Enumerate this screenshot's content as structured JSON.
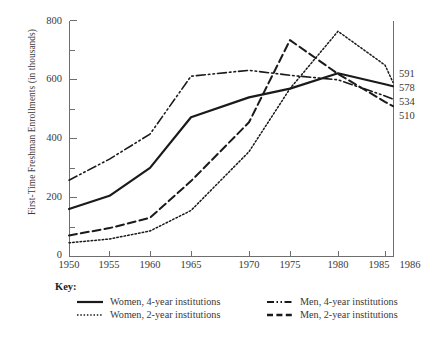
{
  "chart_data": {
    "type": "line",
    "title": "",
    "xlabel": "",
    "ylabel": "First-Time Freshman Enrollments (in thousands)",
    "x": [
      1950,
      1955,
      1960,
      1965,
      1970,
      1975,
      1980,
      1985,
      1986
    ],
    "xtick_labels": [
      "1950",
      "1955",
      "1960",
      "1965",
      "1970",
      "1975",
      "1980",
      "1985",
      "1986"
    ],
    "ytick_labels": [
      "0",
      "200",
      "400",
      "600",
      "800"
    ],
    "ytick_values": [
      0,
      200,
      400,
      600,
      800
    ],
    "yminor_values": [
      100,
      300,
      500,
      700
    ],
    "ylim": [
      0,
      800
    ],
    "grid": false,
    "legend_position": "below-plot",
    "series": [
      {
        "name": "Women, 4-year institutions",
        "style": "solid",
        "color": "#1a1a1a",
        "values": [
          160,
          205,
          300,
          472,
          540,
          570,
          622,
          585,
          578
        ],
        "end_label": "578"
      },
      {
        "name": "Women, 2-year institutions",
        "style": "dotted",
        "color": "#1a1a1a",
        "values": [
          45,
          58,
          85,
          155,
          355,
          570,
          765,
          650,
          591
        ],
        "end_label": "591"
      },
      {
        "name": "Men, 4-year institutions",
        "style": "dash-dot-dot",
        "color": "#1a1a1a",
        "values": [
          258,
          330,
          415,
          612,
          632,
          615,
          600,
          545,
          534
        ],
        "end_label": "534"
      },
      {
        "name": "Men, 2-year institutions",
        "style": "dashed",
        "color": "#1a1a1a",
        "values": [
          70,
          95,
          130,
          255,
          455,
          735,
          620,
          525,
          510
        ],
        "end_label": "510"
      }
    ],
    "end_labels": [
      "591",
      "578",
      "534",
      "510"
    ]
  },
  "key": {
    "title": "Key:",
    "items": [
      {
        "label": "Women, 4-year institutions",
        "style": "solid"
      },
      {
        "label": "Men, 4-year institutions",
        "style": "dash-dot-dot"
      },
      {
        "label": "Women, 2-year institutions",
        "style": "dotted"
      },
      {
        "label": "Men, 2-year institutions",
        "style": "dashed"
      }
    ]
  }
}
